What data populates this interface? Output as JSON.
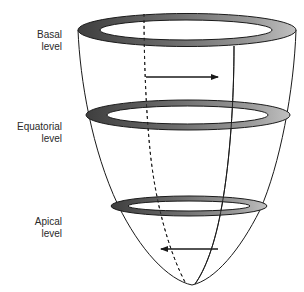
{
  "figure": {
    "type": "diagram",
    "colors": {
      "ring_dark": "#4a4a4a",
      "ring_mid": "#8a8a8a",
      "ring_light": "#b5b5b5",
      "outline": "#1a1a1a",
      "background": "#ffffff"
    }
  },
  "labels": {
    "basal": {
      "line1": "Basal",
      "line2": "level"
    },
    "equatorial": {
      "line1": "Equatorial",
      "line2": "level"
    },
    "apical": {
      "line1": "Apical",
      "line2": "level"
    }
  },
  "arrows": {
    "basal": {
      "direction": "right",
      "meaning": "clockwise rotation at base"
    },
    "apical": {
      "direction": "left",
      "meaning": "counterclockwise rotation at apex"
    }
  },
  "rings": [
    {
      "name": "basal-ring",
      "cx": 187,
      "cy": 30
    },
    {
      "name": "equatorial-ring",
      "cx": 188,
      "cy": 115
    },
    {
      "name": "apical-ring",
      "cx": 189,
      "cy": 206
    }
  ]
}
